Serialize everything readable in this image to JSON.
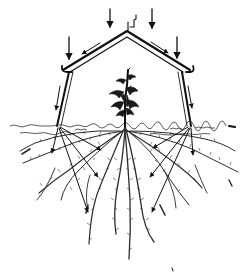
{
  "figure": {
    "type": "illustration",
    "style": "black ink line drawing on white",
    "colors": {
      "ink": "#111111",
      "background": "#ffffff"
    },
    "elements": {
      "rain_arrows": {
        "count": 4,
        "direction": "down",
        "icon": "arrow-down-icon"
      },
      "roof": {
        "shape": "gable",
        "peak": [
          127,
          32
        ],
        "left_eave": [
          65,
          70
        ],
        "right_eave": [
          188,
          70
        ],
        "has_gutters": true,
        "has_chimney_mark": true
      },
      "runoff_arrows_on_roof": {
        "count": 2,
        "direction": "down-slope"
      },
      "posts": {
        "count": 2
      },
      "post_side_arrows": {
        "count": 2,
        "direction": "down"
      },
      "plant": {
        "position_x": 125,
        "type": "young leafy seedling"
      },
      "ground_line_y": 127,
      "soil_arrows": {
        "left_fan_count": 4,
        "right_fan_count": 4,
        "description": "arrows radiating from post bases into the soil toward roots"
      },
      "root_system": {
        "type": "fibrous, spreading",
        "depth_px": 150
      }
    },
    "text_labels": []
  }
}
